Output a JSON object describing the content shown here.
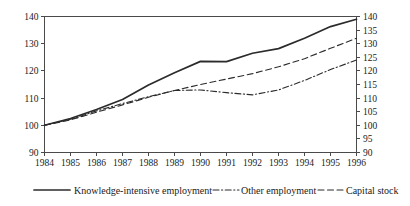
{
  "chart_data": {
    "type": "line",
    "title": "",
    "subtitle": "",
    "xlabel": "",
    "ylabel": "",
    "x": [
      1984,
      1985,
      1986,
      1987,
      1988,
      1989,
      1990,
      1991,
      1992,
      1993,
      1994,
      1995,
      1996
    ],
    "categories": [
      "1984",
      "1985",
      "1986",
      "1987",
      "1988",
      "1989",
      "1990",
      "1991",
      "1992",
      "1993",
      "1994",
      "1995",
      "1996"
    ],
    "series": [
      {
        "name": "Knowledge-intensive employment",
        "style": "solid",
        "color": "#2b2b2b",
        "values": [
          100.0,
          102.5,
          105.8,
          109.5,
          114.8,
          119.3,
          123.5,
          123.4,
          126.5,
          128.2,
          132.0,
          136.3,
          139.0
        ]
      },
      {
        "name": "Other employment",
        "style": "dashed",
        "color": "#2b2b2b",
        "values": [
          100.0,
          102.0,
          104.8,
          107.5,
          110.3,
          112.8,
          115.0,
          117.0,
          119.0,
          121.5,
          124.5,
          128.3,
          132.0
        ]
      },
      {
        "name": "Capital stock",
        "style": "dash-dot",
        "color": "#2b2b2b",
        "values": [
          100.0,
          102.2,
          105.3,
          108.0,
          110.5,
          112.8,
          113.0,
          112.0,
          111.2,
          113.0,
          116.5,
          120.5,
          124.0
        ]
      }
    ],
    "axes": {
      "x": {
        "min": 1984,
        "max": 1996,
        "ticks": [
          "1984",
          "1985",
          "1986",
          "1987",
          "1988",
          "1989",
          "1990",
          "1991",
          "1992",
          "1993",
          "1994",
          "1995",
          "1996"
        ]
      },
      "y_left": {
        "min": 90,
        "max": 140,
        "step": 10,
        "ticks": [
          "90",
          "100",
          "110",
          "120",
          "130",
          "140"
        ]
      },
      "y_right": {
        "min": 90,
        "max": 140,
        "step": 5,
        "ticks": [
          "90",
          "95",
          "100",
          "105",
          "110",
          "115",
          "120",
          "125",
          "130",
          "135",
          "140"
        ]
      }
    },
    "grid": false,
    "legend_position": "bottom"
  },
  "legend": {
    "items": [
      {
        "label": "Knowledge-intensive employment",
        "style": "solid"
      },
      {
        "label": "Other employment",
        "style": "dash-dot"
      },
      {
        "label": "Capital stock",
        "style": "dashed"
      }
    ]
  }
}
